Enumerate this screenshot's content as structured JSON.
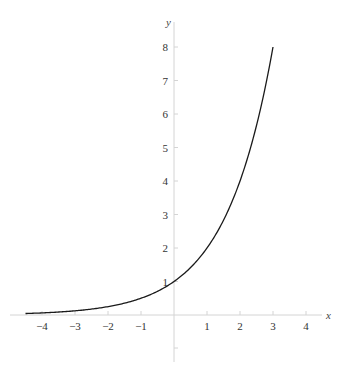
{
  "chart_data": {
    "type": "line",
    "title": "",
    "function": "y = 2^x",
    "xlabel": "x",
    "ylabel": "y",
    "xlim": [
      -4.5,
      4.5
    ],
    "ylim": [
      -1.5,
      8.8
    ],
    "grid": false,
    "x_ticks": [
      -4,
      -3,
      -2,
      -1,
      1,
      2,
      3,
      4
    ],
    "x_tick_labels": [
      "−4",
      "−3",
      "−2",
      "−1",
      "1",
      "2",
      "3",
      "4"
    ],
    "y_ticks": [
      1,
      2,
      3,
      4,
      5,
      6,
      7,
      8
    ],
    "y_tick_labels": [
      "1",
      "2",
      "3",
      "4",
      "5",
      "6",
      "7",
      "8"
    ],
    "series": [
      {
        "name": "2^x",
        "x": [
          -4.5,
          -4,
          -3,
          -2,
          -1,
          0,
          1,
          2,
          3
        ],
        "values": [
          0.044,
          0.0625,
          0.125,
          0.25,
          0.5,
          1,
          2,
          4,
          8
        ]
      }
    ],
    "domain": [
      -4.5,
      3
    ]
  },
  "colors": {
    "axis": "#d4d4d4",
    "curve": "#1a1a1a",
    "text": "#333333"
  }
}
